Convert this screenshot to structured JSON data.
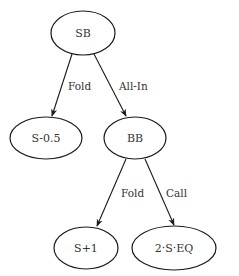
{
  "diagram": {
    "type": "game-tree",
    "nodes": [
      {
        "id": "sb",
        "label": "SB",
        "cx": 83,
        "cy": 33,
        "rx": 32,
        "ry": 22
      },
      {
        "id": "s-0.5",
        "label": "S-0.5",
        "cx": 46,
        "cy": 138,
        "rx": 36,
        "ry": 21
      },
      {
        "id": "bb",
        "label": "BB",
        "cx": 135,
        "cy": 138,
        "rx": 31,
        "ry": 21
      },
      {
        "id": "s+1",
        "label": "S+1",
        "cx": 86,
        "cy": 248,
        "rx": 32,
        "ry": 21
      },
      {
        "id": "2-s-eq",
        "label": "2·S·EQ",
        "cx": 174,
        "cy": 248,
        "rx": 42,
        "ry": 22
      }
    ],
    "edges": [
      {
        "from": "sb",
        "to": "s-0.5",
        "label": "Fold"
      },
      {
        "from": "sb",
        "to": "bb",
        "label": "All-In"
      },
      {
        "from": "bb",
        "to": "s+1",
        "label": "Fold"
      },
      {
        "from": "bb",
        "to": "2-s-eq",
        "label": "Call"
      }
    ]
  }
}
